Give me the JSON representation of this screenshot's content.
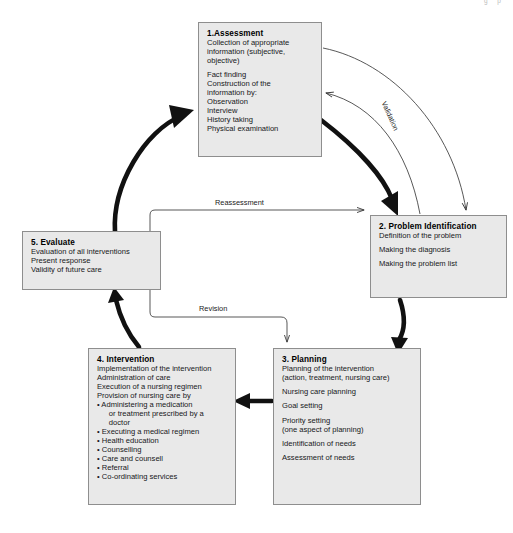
{
  "diagram": {
    "type": "cycle-flow",
    "colors": {
      "node_fill": "#e9e9e9",
      "node_border": "#8e8e8e",
      "thick_arrow": "#111111",
      "thin_arrow": "#3a3a3a",
      "text": "#1a1a1a"
    }
  },
  "page_corner_text": "g p",
  "nodes": {
    "assessment": {
      "title": "1.Assessment",
      "lines": [
        "Collection of appropriate",
        "information (subjective,",
        "objective)"
      ],
      "lines2": [
        "Fact finding",
        "Construction of the",
        "information by:",
        "Observation",
        "Interview",
        "History taking",
        "Physical examination"
      ]
    },
    "problem": {
      "title": "2. Problem Identification",
      "lines": [
        "Definition of the problem"
      ],
      "lines2": [
        "Making the diagnosis"
      ],
      "lines3": [
        "Making the problem list"
      ]
    },
    "planning": {
      "title": "3. Planning",
      "lines": [
        "Planning of the intervention",
        "(action, treatment, nursing care)"
      ],
      "lines2": [
        "Nursing care planning"
      ],
      "lines3": [
        "Goal setting"
      ],
      "lines4": [
        "Priority setting",
        "(one aspect of planning)"
      ],
      "lines5": [
        "Identification of needs"
      ],
      "lines6": [
        "Assessment of needs"
      ]
    },
    "intervention": {
      "title": "4. Intervention",
      "lines": [
        "Implementation of the intervention",
        "Administration of care",
        "Execution of a nursing regimen",
        "Provision of nursing care by"
      ],
      "bullets": [
        "• Administering a medication",
        "   or treatment prescribed by a",
        "   doctor",
        "• Executing a medical regimen",
        "• Health education",
        "• Counselling",
        "• Care and counsell",
        "• Referral",
        "• Co-ordinating services"
      ]
    },
    "evaluate": {
      "title": "5. Evaluate",
      "lines": [
        "Evaluation of all interventions",
        "Present response",
        "Validity of future care"
      ]
    }
  },
  "edges": {
    "reassessment": {
      "label": "Reassessment",
      "from": "5. Evaluate",
      "to": "2. Problem Identification",
      "style": "thin"
    },
    "revision": {
      "label": "Revision",
      "from": "5. Evaluate",
      "to": "3. Planning",
      "style": "thin"
    },
    "validation": {
      "label": "Validation",
      "from": "2. Problem Identification",
      "to": "1.Assessment",
      "style": "thin-curved"
    },
    "assessment_to_problem_thin": {
      "label": "",
      "from": "1.Assessment",
      "to": "2. Problem Identification",
      "style": "thin-curved"
    },
    "assessment_to_problem": {
      "label": "",
      "from": "1.Assessment",
      "to": "2. Problem Identification",
      "style": "thick"
    },
    "problem_to_planning": {
      "label": "",
      "from": "2. Problem Identification",
      "to": "3. Planning",
      "style": "thick"
    },
    "planning_to_intervention": {
      "label": "",
      "from": "3. Planning",
      "to": "4. Intervention",
      "style": "thick"
    },
    "intervention_to_evaluate": {
      "label": "",
      "from": "4. Intervention",
      "to": "5. Evaluate",
      "style": "thick"
    },
    "evaluate_to_assessment": {
      "label": "",
      "from": "5. Evaluate",
      "to": "1.Assessment",
      "style": "thick"
    }
  }
}
